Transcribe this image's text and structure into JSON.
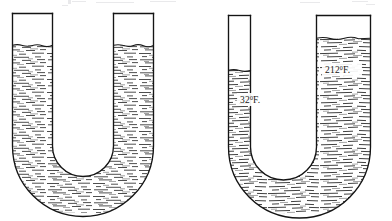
{
  "figure": {
    "title": "",
    "type": "u-tube-liquid-level-diagram",
    "background_color": "#ffffff",
    "ink_color": "#1a1a1a",
    "liquid_hatch_color": "#3a3a3a"
  },
  "tubes": [
    {
      "id": "left-utube",
      "name": "u-tube-equal-temperature",
      "left_arm": {
        "name": "left-arm",
        "outer_x": 11,
        "inner_x": 55,
        "top_y": 13,
        "liquid_level_y": 45,
        "label": ""
      },
      "right_arm": {
        "name": "right-arm",
        "inner_x": 112,
        "outer_x": 155,
        "top_y": 13,
        "liquid_level_y": 45,
        "label": ""
      },
      "bottom_outer_y": 207,
      "bottom_inner_y": 167,
      "labels": []
    },
    {
      "id": "right-utube",
      "name": "u-tube-unequal-temperature",
      "left_arm": {
        "name": "left-arm",
        "outer_x": 227,
        "inner_x": 272,
        "top_y": 15,
        "liquid_level_y": 70,
        "label": "32",
        "degree": "0",
        "unit": "F."
      },
      "right_arm": {
        "name": "right-arm",
        "inner_x": 316,
        "outer_x": 372,
        "top_y": 15,
        "liquid_level_y": 38,
        "label": "212",
        "degree": "0",
        "unit": "F."
      },
      "bottom_outer_y": 209,
      "bottom_inner_y": 167,
      "labels": [
        {
          "name": "temperature-label-cold",
          "text": "32",
          "degree": "0",
          "unit": "F.",
          "full_text": "32°F.",
          "x": 240,
          "y": 102
        },
        {
          "name": "temperature-label-hot",
          "text": "212",
          "degree": "0",
          "unit": "F.",
          "full_text": "212°F.",
          "x": 325,
          "y": 72
        }
      ]
    }
  ],
  "annotations": {
    "cold_label": "32",
    "cold_degree": "0",
    "cold_unit": "F.",
    "hot_label": "212",
    "hot_degree": "0",
    "hot_unit": "F."
  }
}
